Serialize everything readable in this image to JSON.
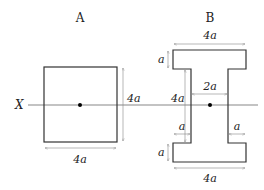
{
  "diagram": {
    "title_a": "A",
    "title_b": "B",
    "axis_label": "X",
    "square": {
      "width_label": "4a",
      "height_label": "4a"
    },
    "ibeam": {
      "top_width_label": "4a",
      "bottom_width_label": "4a",
      "top_flange_thickness_label": "a",
      "bottom_flange_thickness_label": "a",
      "web_width_label": "2a",
      "overall_height_label": "4a",
      "left_overhang_label": "a",
      "right_overhang_label": "a"
    },
    "colors": {
      "shape_stroke": "#333333",
      "dimension_line": "#888888",
      "axis_line": "#555555",
      "centroid": "#000000"
    }
  }
}
